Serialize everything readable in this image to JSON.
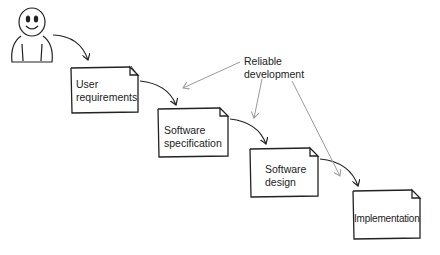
{
  "diagram": {
    "type": "waterfall-process",
    "actor": {
      "icon": "smiley-person-icon"
    },
    "steps": [
      {
        "label": "User requirements",
        "lines": [
          "User",
          "requirements"
        ]
      },
      {
        "label": "Software specification",
        "lines": [
          "Software",
          "specification"
        ]
      },
      {
        "label": "Software design",
        "lines": [
          "Software",
          "design"
        ]
      },
      {
        "label": "Implementation",
        "lines": [
          "Implementation"
        ]
      }
    ],
    "annotation": {
      "label": "Reliable development",
      "lines": [
        "Reliable",
        "development"
      ],
      "points_to": [
        "Software specification",
        "Software design",
        "Implementation"
      ]
    },
    "colors": {
      "stroke": "#222222",
      "annotation_arrow": "#999999",
      "background": "#ffffff"
    }
  }
}
